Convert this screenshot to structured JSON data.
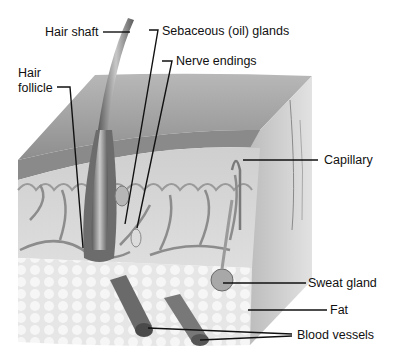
{
  "figure": {
    "labels": [
      {
        "id": "hair-shaft",
        "text": "Hair shaft"
      },
      {
        "id": "sebaceous-glands",
        "text": "Sebaceous (oil) glands"
      },
      {
        "id": "nerve-endings",
        "text": "Nerve endings"
      },
      {
        "id": "hair-follicle",
        "text_line1": "Hair",
        "text_line2": "follicle"
      },
      {
        "id": "capillary",
        "text": "Capillary"
      },
      {
        "id": "sweat-gland",
        "text": "Sweat gland"
      },
      {
        "id": "fat",
        "text": "Fat"
      },
      {
        "id": "blood-vessels",
        "text": "Blood vessels"
      }
    ],
    "colors": {
      "background": "#ffffff",
      "epidermis": "#9a9a9a",
      "dermis": "#d4d4d4",
      "fat": "#ececec",
      "vessel": "#6a6a6a",
      "leader_line": "#111111"
    }
  }
}
